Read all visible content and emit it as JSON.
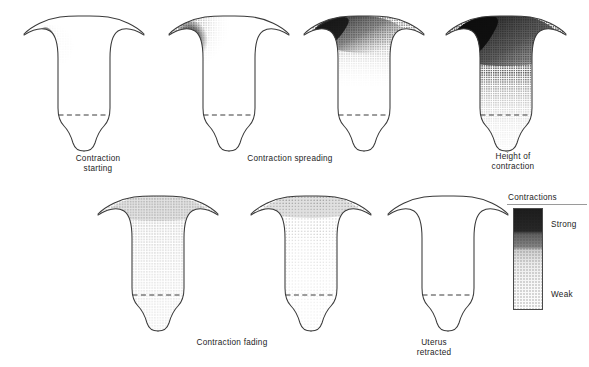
{
  "figure": {
    "line_color": "#3a3a3a",
    "stipple_color": "#1a1a1a"
  },
  "panels": [
    {
      "id": "contraction-starting",
      "caption": "Contraction\nstarting",
      "caption_x": 98,
      "caption_y": 154,
      "x": 18,
      "y": 12,
      "shading": "pacemaker-spot-upper-left",
      "intensity": "strong-localised"
    },
    {
      "id": "contraction-spreading",
      "caption": "Contraction spreading",
      "caption_x": 290,
      "caption_y": 154,
      "x": 163,
      "y": 12,
      "shading": "upper-left-quadrant-fading-right",
      "intensity": "strong-to-weak"
    },
    {
      "id": "contraction-spreading-wider",
      "caption": "",
      "caption_x": 0,
      "caption_y": 0,
      "x": 298,
      "y": 10,
      "shading": "fundal-band-fading-downward",
      "intensity": "strong-to-weak"
    },
    {
      "id": "height-of-contraction",
      "caption": "Height of\ncontraction",
      "caption_x": 513,
      "caption_y": 152,
      "x": 440,
      "y": 10,
      "shading": "full-fundus-dark-over-stippled-body",
      "intensity": "maximum"
    },
    {
      "id": "contraction-fading",
      "caption": "Contraction fading",
      "caption_x": 232,
      "caption_y": 338,
      "x": 92,
      "y": 190,
      "shading": "uniform-light-stipple",
      "intensity": "weak"
    },
    {
      "id": "contraction-fading-late",
      "caption": "",
      "caption_x": 0,
      "caption_y": 0,
      "x": 245,
      "y": 190,
      "shading": "faint-fundal-stipple",
      "intensity": "very-weak"
    },
    {
      "id": "uterus-retracted",
      "caption": "Uterus\nretracted",
      "caption_x": 434,
      "caption_y": 338,
      "x": 382,
      "y": 190,
      "shading": "none",
      "intensity": "none"
    }
  ],
  "legend": {
    "title": "Contractions",
    "strong_label": "Strong",
    "weak_label": "Weak",
    "gradient_top_color": "#141414",
    "gradient_bottom_color": "#fdfdfd"
  }
}
